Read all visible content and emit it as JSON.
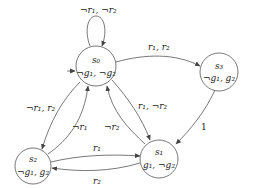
{
  "diagram": {
    "type": "state-machine",
    "nodes": [
      {
        "id": "s0",
        "name": "s₀",
        "props": "¬g₁, ¬g₂",
        "initial": true
      },
      {
        "id": "s3",
        "name": "s₃",
        "props": "¬g₁, g₂"
      },
      {
        "id": "s1",
        "name": "s₁",
        "props": "g₁, ¬g₂"
      },
      {
        "id": "s2",
        "name": "s₂",
        "props": "¬g₁, g₂"
      }
    ],
    "edges": [
      {
        "from": "s0",
        "to": "s0",
        "label": "¬r₁, ¬r₂"
      },
      {
        "from": "s0",
        "to": "s3",
        "label": "r₁, r₂"
      },
      {
        "from": "s0",
        "to": "s2",
        "label": "¬r₁, r₂"
      },
      {
        "from": "s0",
        "to": "s1",
        "label": "r₁, ¬r₂"
      },
      {
        "from": "s2",
        "to": "s0",
        "label": "¬r₁"
      },
      {
        "from": "s1",
        "to": "s0",
        "label": "¬r₂"
      },
      {
        "from": "s3",
        "to": "s1",
        "label": "1"
      },
      {
        "from": "s2",
        "to": "s1",
        "label": "r₁"
      },
      {
        "from": "s1",
        "to": "s2",
        "label": "r₂"
      }
    ]
  }
}
